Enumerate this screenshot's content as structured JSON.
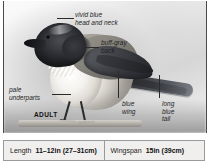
{
  "plate": {
    "subject_caption": "ADULT",
    "annotations": [
      {
        "id": "head-neck",
        "line1": "vivid blue",
        "line2": "head and neck"
      },
      {
        "id": "back",
        "line1": "buff-gray",
        "line2": "back"
      },
      {
        "id": "underparts",
        "line1": "pale",
        "line2": "underparts"
      },
      {
        "id": "wing",
        "line1": "blue",
        "line2": "wing"
      },
      {
        "id": "tail",
        "line1": "long",
        "line2": "blue",
        "line3": "tail"
      }
    ]
  },
  "measurements": [
    {
      "label": "Length",
      "value": "11–12in (27–31cm)"
    },
    {
      "label": "Wingspan",
      "value": "15in (39cm)"
    }
  ],
  "colors": {
    "frame_line": "#4a4a4a",
    "measure_border": "#9a9a9a",
    "measure_fill": "#f0efed",
    "label_text": "#1f1f1f",
    "leader_line": "#2b2b2b"
  }
}
